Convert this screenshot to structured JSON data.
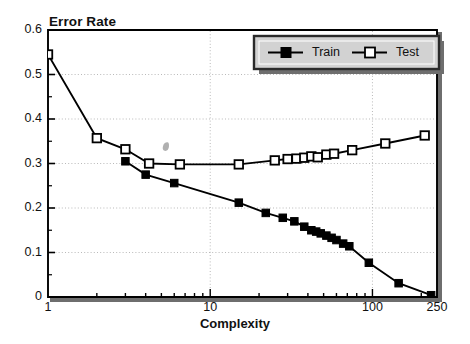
{
  "chart_data": {
    "type": "line",
    "title": "Error Rate",
    "xlabel": "Complexity",
    "ylabel": "Error Rate",
    "xscale": "log",
    "yscale": "linear",
    "xlim": [
      1,
      250
    ],
    "ylim": [
      0,
      0.6
    ],
    "grid": true,
    "grid_style": "dotted",
    "legend_position": "top-right",
    "xticks": [
      1,
      10,
      100,
      250
    ],
    "xticklabels": [
      "1",
      "10",
      "100",
      "250"
    ],
    "yticks": [
      0,
      0.1,
      0.2,
      0.3,
      0.4,
      0.5,
      0.6
    ],
    "yticklabels": [
      "0",
      "0.1",
      "0.2",
      "0.3",
      "0.4",
      "0.5",
      "0.6"
    ],
    "yminorticks": [
      0.05,
      0.15,
      0.25,
      0.35,
      0.45,
      0.55
    ],
    "series": [
      {
        "name": "Train",
        "marker": "filled-square",
        "color": "#000000",
        "points": [
          {
            "x": 3.0,
            "y": 0.305
          },
          {
            "x": 4.0,
            "y": 0.275
          },
          {
            "x": 6.0,
            "y": 0.256
          },
          {
            "x": 15.0,
            "y": 0.212
          },
          {
            "x": 22.0,
            "y": 0.189
          },
          {
            "x": 28.0,
            "y": 0.178
          },
          {
            "x": 33.0,
            "y": 0.17
          },
          {
            "x": 38.0,
            "y": 0.158
          },
          {
            "x": 42.0,
            "y": 0.15
          },
          {
            "x": 45.0,
            "y": 0.147
          },
          {
            "x": 48.0,
            "y": 0.143
          },
          {
            "x": 52.0,
            "y": 0.138
          },
          {
            "x": 56.0,
            "y": 0.133
          },
          {
            "x": 60.0,
            "y": 0.128
          },
          {
            "x": 66.0,
            "y": 0.12
          },
          {
            "x": 72.0,
            "y": 0.114
          },
          {
            "x": 95.0,
            "y": 0.077
          },
          {
            "x": 145.0,
            "y": 0.031
          },
          {
            "x": 230.0,
            "y": 0.004
          }
        ]
      },
      {
        "name": "Test",
        "marker": "open-square",
        "color": "#000000",
        "points": [
          {
            "x": 1.0,
            "y": 0.545
          },
          {
            "x": 2.0,
            "y": 0.357
          },
          {
            "x": 3.0,
            "y": 0.332
          },
          {
            "x": 4.2,
            "y": 0.3
          },
          {
            "x": 6.5,
            "y": 0.298
          },
          {
            "x": 15.0,
            "y": 0.298
          },
          {
            "x": 25.0,
            "y": 0.307
          },
          {
            "x": 30.0,
            "y": 0.31
          },
          {
            "x": 34.0,
            "y": 0.311
          },
          {
            "x": 38.0,
            "y": 0.313
          },
          {
            "x": 42.0,
            "y": 0.316
          },
          {
            "x": 46.0,
            "y": 0.314
          },
          {
            "x": 52.0,
            "y": 0.32
          },
          {
            "x": 58.0,
            "y": 0.322
          },
          {
            "x": 75.0,
            "y": 0.33
          },
          {
            "x": 120.0,
            "y": 0.345
          },
          {
            "x": 210.0,
            "y": 0.363
          }
        ]
      }
    ]
  },
  "legend": {
    "entries": [
      {
        "label": "Train",
        "marker": "filled-square"
      },
      {
        "label": "Test",
        "marker": "open-square"
      }
    ]
  },
  "axes": {
    "title": "Error Rate",
    "xlabel": "Complexity"
  }
}
